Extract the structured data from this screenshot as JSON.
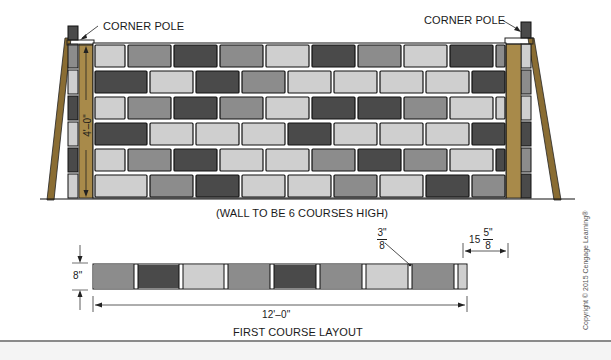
{
  "diagram": {
    "type": "masonry wall elevation and first course layout",
    "labels": {
      "corner_pole_left": "CORNER POLE",
      "corner_pole_right": "CORNER POLE",
      "wall_height": "4'–0\"",
      "wall_note": "(WALL TO BE 6 COURSES HIGH)",
      "joint_fraction_num": "3\"",
      "joint_fraction_den": "8",
      "block_length_whole": "15",
      "block_length_num": "5\"",
      "block_length_den": "8",
      "course_height": "8\"",
      "course_length": "12'–0\"",
      "layout_title": "FIRST COURSE LAYOUT",
      "copyright": "Copyright © 2015 Cengage Learning®"
    },
    "wall": {
      "courses": 6,
      "colors": {
        "dark": "#4a4a4a",
        "medium": "#8c8c8c",
        "light": "#cfcfcf",
        "pole_wood": "#a88a4a",
        "pole_wood_dark": "#8a6d33",
        "mortar": "#ffffff",
        "outline": "#111111"
      }
    },
    "first_course": {
      "blocks": [
        "medium",
        "dark",
        "light",
        "medium",
        "dark",
        "medium",
        "light",
        "medium",
        "light"
      ]
    }
  }
}
